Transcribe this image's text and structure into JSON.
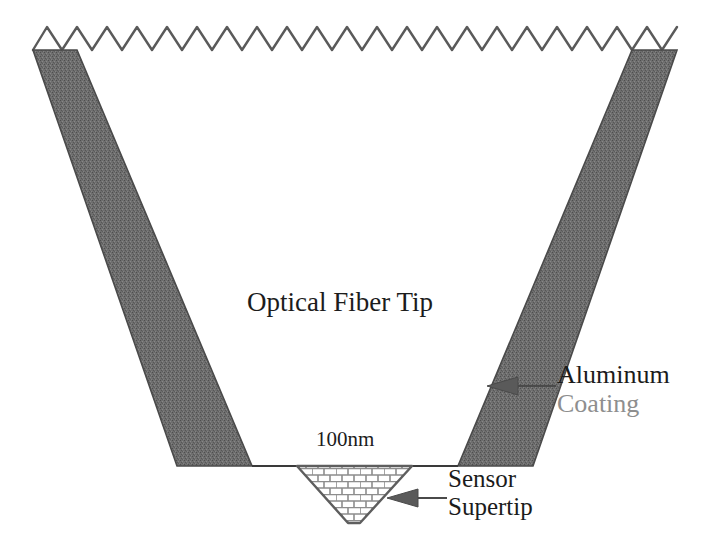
{
  "figure": {
    "background_color": "#ffffff"
  },
  "labels": {
    "fiber_tip": "Optical Fiber Tip",
    "scale": "100nm",
    "aluminum": "Aluminum",
    "coating": "Coating",
    "sensor": "Sensor",
    "supertip": "Supertip"
  },
  "colors": {
    "coating_fill": "#6e6e6e",
    "outline": "#3a3a3a",
    "brick_line": "#8a8a8a",
    "aluminum_text": "#1b1b1b",
    "coating_text": "#8e8e8e",
    "body_text": "#1c1c1c",
    "arrow": "#4a4a4a"
  },
  "elements": {
    "zigzag_peaks": 21,
    "left_coating_band": "tapered dark band on the left side of the fiber cone",
    "right_coating_band": "tapered dark band on the right side of the fiber cone",
    "supertip_shape": "inverted truncated triangle with brick hatch pattern",
    "brick_rows": 8
  },
  "annotations": [
    {
      "name": "aluminum-coating-arrow",
      "points_to": "right coating band",
      "direction": "left"
    },
    {
      "name": "sensor-supertip-arrow",
      "points_to": "supertip lower-right edge",
      "direction": "left"
    }
  ]
}
